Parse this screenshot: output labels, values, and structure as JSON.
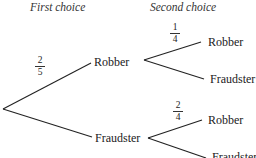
{
  "headers": {
    "first": "First choice",
    "second": "Second choice"
  },
  "tree": {
    "level1": [
      {
        "label": "Robber",
        "probability": {
          "num": "2",
          "den": "5"
        }
      },
      {
        "label": "Fraudster"
      }
    ],
    "level2": {
      "robber": [
        {
          "label": "Robber",
          "probability": {
            "num": "1",
            "den": "4"
          }
        },
        {
          "label": "Fraudster"
        }
      ],
      "fraudster": [
        {
          "label": "Robber",
          "probability": {
            "num": "2",
            "den": "4"
          }
        },
        {
          "label": "Fraudster"
        }
      ]
    }
  },
  "colors": {
    "line": "#222222",
    "text": "#222222",
    "background": "#ffffff"
  }
}
